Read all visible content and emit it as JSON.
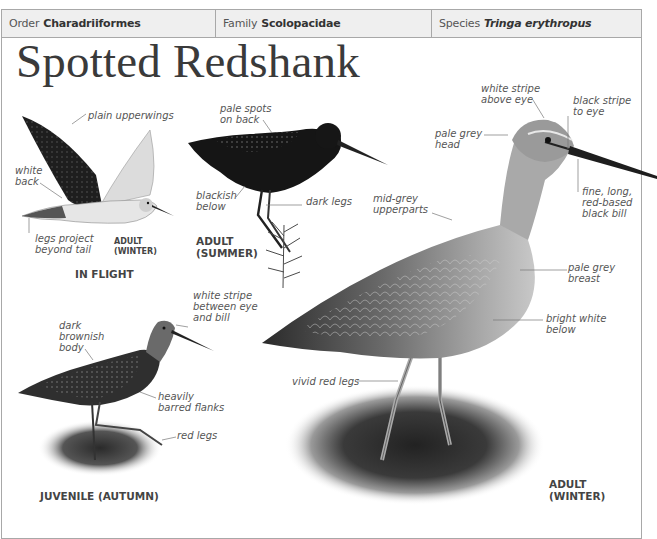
{
  "header": {
    "order": {
      "label": "Order",
      "value": "Charadriiformes"
    },
    "family": {
      "label": "Family",
      "value": "Scolopacidae"
    },
    "species": {
      "label": "Species",
      "value": "Tringa erythropus"
    }
  },
  "title": "Spotted Redshank",
  "illustrations": {
    "in_flight": {
      "caption": "IN FLIGHT",
      "sub_caption_1": "ADULT",
      "sub_caption_2": "(WINTER)",
      "annotations": {
        "upperwings": "plain upperwings",
        "back_1": "white",
        "back_2": "back",
        "legs_1": "legs project",
        "legs_2": "beyond tail"
      }
    },
    "adult_summer": {
      "caption_1": "ADULT",
      "caption_2": "(SUMMER)",
      "annotations": {
        "spots_1": "pale spots",
        "spots_2": "on back",
        "below_1": "blackish",
        "below_2": "below",
        "legs": "dark legs"
      }
    },
    "adult_winter": {
      "caption_1": "ADULT",
      "caption_2": "(WINTER)",
      "annotations": {
        "stripe_above_1": "white stripe",
        "stripe_above_2": "above eye",
        "stripe_to_eye_1": "black stripe",
        "stripe_to_eye_2": "to eye",
        "head_1": "pale grey",
        "head_2": "head",
        "bill_1": "fine, long,",
        "bill_2": "red-based",
        "bill_3": "black bill",
        "upper_1": "mid-grey",
        "upper_2": "upperparts",
        "breast_1": "pale grey",
        "breast_2": "breast",
        "below_1": "bright white",
        "below_2": "below",
        "legs": "vivid red legs"
      }
    },
    "juvenile": {
      "caption": "JUVENILE (AUTUMN)",
      "annotations": {
        "stripe_1": "white stripe",
        "stripe_2": "between eye",
        "stripe_3": "and bill",
        "body_1": "dark",
        "body_2": "brownish",
        "body_3": "body",
        "flanks_1": "heavily",
        "flanks_2": "barred flanks",
        "legs": "red legs"
      }
    }
  }
}
